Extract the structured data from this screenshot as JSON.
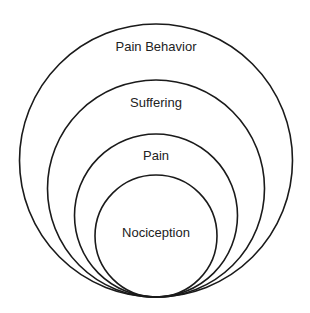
{
  "diagram": {
    "type": "nested-tangent-circles",
    "background": "#ffffff",
    "stroke_color": "#1a1a1a",
    "text_color": "#222222",
    "layers": [
      {
        "label": "Pain Behavior",
        "cx": 156,
        "cy": 160.5,
        "r": 136.5,
        "label_y": 51
      },
      {
        "label": "Suffering",
        "cx": 156,
        "cy": 188.5,
        "r": 108.5,
        "label_y": 107
      },
      {
        "label": "Pain",
        "cx": 156,
        "cy": 215.5,
        "r": 81.5,
        "label_y": 160
      },
      {
        "label": "Nociception",
        "cx": 156,
        "cy": 236,
        "r": 61,
        "label_y": 237
      }
    ]
  }
}
